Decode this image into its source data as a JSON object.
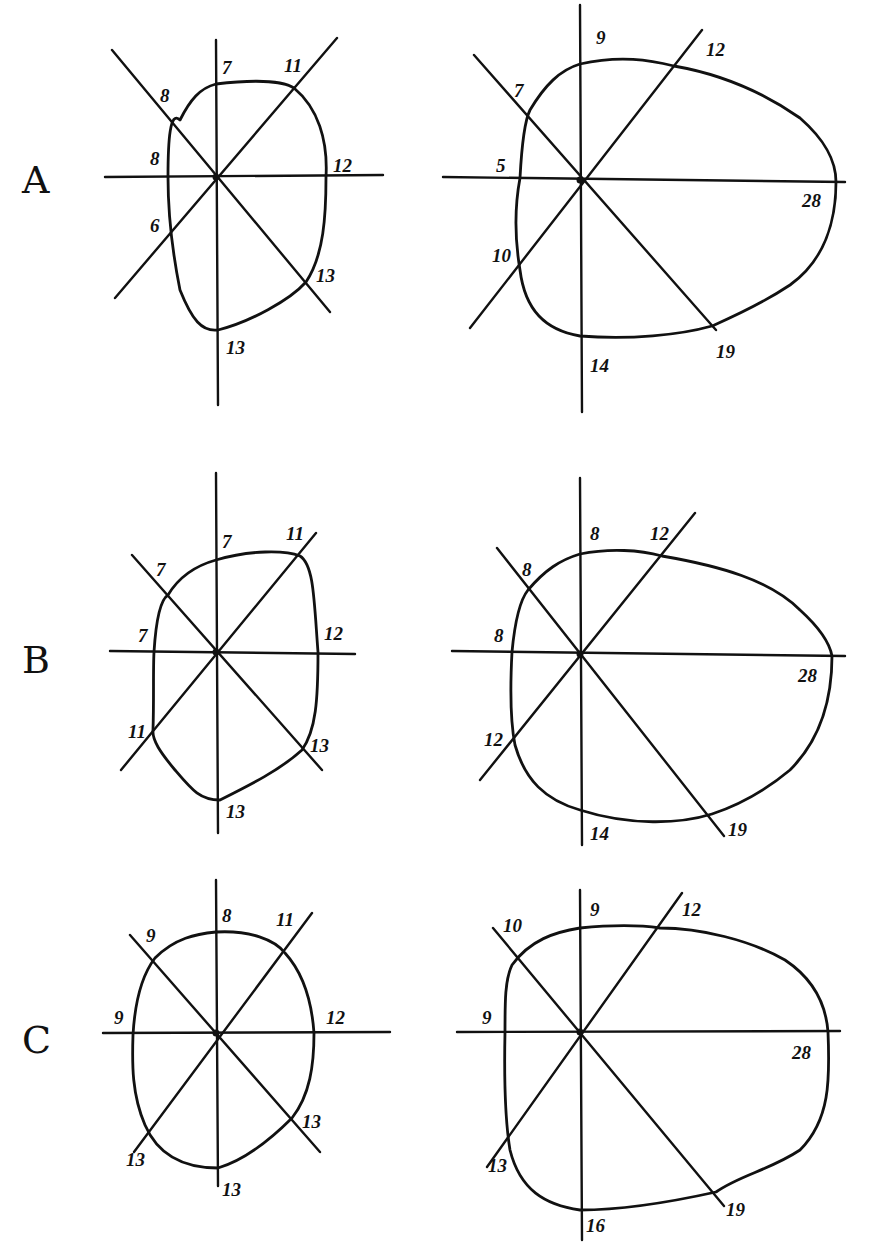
{
  "figure": {
    "rows": [
      {
        "letter": "A",
        "letter_pos": [
          22,
          193
        ],
        "panels": [
          {
            "id": "A-left",
            "center": [
              216,
              177
            ],
            "axes": {
              "vertical": [
                [
                  216,
                  40
                ],
                [
                  218,
                  405
                ]
              ],
              "horizontal": [
                [
                  105,
                  177
                ],
                [
                  383,
                  175
                ]
              ],
              "diag_up": [
                [
                  115,
                  298
                ],
                [
                  337,
                  38
                ]
              ],
              "diag_down": [
                [
                  112,
                  50
                ],
                [
                  330,
                  312
                ]
              ]
            },
            "outline": "M216,84 C250,80 282,80 294,88 C318,108 328,140 326,177 C326,215 324,255 306,282 C290,300 250,322 218,330 C202,332 192,320 180,290 C172,250 168,215 168,177 C168,140 170,110 180,120 C190,100 200,88 216,84 Z",
            "labels": [
              {
                "text": "7",
                "x": 222,
                "y": 74
              },
              {
                "text": "11",
                "x": 284,
                "y": 72
              },
              {
                "text": "8",
                "x": 160,
                "y": 102
              },
              {
                "text": "8",
                "x": 150,
                "y": 165
              },
              {
                "text": "12",
                "x": 333,
                "y": 172
              },
              {
                "text": "6",
                "x": 150,
                "y": 232
              },
              {
                "text": "13",
                "x": 316,
                "y": 282
              },
              {
                "text": "13",
                "x": 226,
                "y": 354
              }
            ]
          },
          {
            "id": "A-right",
            "center": [
              580,
              180
            ],
            "axes": {
              "vertical": [
                [
                  580,
                  5
                ],
                [
                  582,
                  412
                ]
              ],
              "horizontal": [
                [
                  443,
                  177
                ],
                [
                  845,
                  182
                ]
              ],
              "diag_up": [
                [
                  470,
                  328
                ],
                [
                  702,
                  30
                ]
              ],
              "diag_down": [
                [
                  474,
                  55
                ],
                [
                  716,
                  330
                ]
              ]
            },
            "outline": "M580,64 C620,55 650,60 674,66 C720,74 760,90 800,118 C825,140 836,160 836,182 C836,220 825,260 790,285 C760,305 730,318 712,326 C680,335 630,340 580,336 C545,330 525,310 520,270 C515,240 514,210 520,178 C522,140 525,120 530,110 C545,85 560,70 580,64 Z",
            "labels": [
              {
                "text": "9",
                "x": 596,
                "y": 44
              },
              {
                "text": "12",
                "x": 706,
                "y": 56
              },
              {
                "text": "7",
                "x": 514,
                "y": 97
              },
              {
                "text": "5",
                "x": 496,
                "y": 172
              },
              {
                "text": "28",
                "x": 802,
                "y": 207
              },
              {
                "text": "10",
                "x": 492,
                "y": 262
              },
              {
                "text": "14",
                "x": 590,
                "y": 372
              },
              {
                "text": "19",
                "x": 716,
                "y": 358
              }
            ]
          }
        ]
      },
      {
        "letter": "B",
        "letter_pos": [
          22,
          673
        ],
        "panels": [
          {
            "id": "B-left",
            "center": [
              216,
              652
            ],
            "axes": {
              "vertical": [
                [
                  216,
                  473
                ],
                [
                  218,
                  833
                ]
              ],
              "horizontal": [
                [
                  110,
                  651
                ],
                [
                  355,
                  654
                ]
              ],
              "diag_up": [
                [
                  121,
                  770
                ],
                [
                  316,
                  533
                ]
              ],
              "diag_down": [
                [
                  132,
                  555
                ],
                [
                  322,
                  770
                ]
              ]
            },
            "outline": "M216,560 C250,550 285,550 300,556 C314,565 314,600 318,652 C318,700 316,730 302,750 C280,770 250,785 220,800 C200,800 192,790 175,770 C160,752 152,740 153,730 C154,700 153,670 154,652 C156,620 160,600 168,595 C180,575 198,565 216,560 Z",
            "labels": [
              {
                "text": "7",
                "x": 222,
                "y": 548
              },
              {
                "text": "11",
                "x": 286,
                "y": 540
              },
              {
                "text": "7",
                "x": 156,
                "y": 576
              },
              {
                "text": "7",
                "x": 138,
                "y": 642
              },
              {
                "text": "12",
                "x": 324,
                "y": 640
              },
              {
                "text": "11",
                "x": 128,
                "y": 738
              },
              {
                "text": "13",
                "x": 310,
                "y": 752
              },
              {
                "text": "13",
                "x": 226,
                "y": 818
              }
            ]
          },
          {
            "id": "B-right",
            "center": [
              580,
              654
            ],
            "axes": {
              "vertical": [
                [
                  580,
                  478
                ],
                [
                  582,
                  845
                ]
              ],
              "horizontal": [
                [
                  452,
                  651
                ],
                [
                  845,
                  656
                ]
              ],
              "diag_up": [
                [
                  480,
                  780
                ],
                [
                  695,
                  513
                ]
              ],
              "diag_down": [
                [
                  497,
                  548
                ],
                [
                  724,
                  836
                ]
              ]
            },
            "outline": "M580,554 C610,548 640,550 662,556 C720,566 770,580 800,610 C822,630 830,645 832,656 C832,700 820,740 790,770 C760,795 730,808 712,814 C680,824 630,826 580,810 C545,800 525,780 515,745 C510,720 510,690 512,652 C515,620 520,600 528,590 C545,570 560,560 580,554 Z",
            "labels": [
              {
                "text": "8",
                "x": 590,
                "y": 540
              },
              {
                "text": "12",
                "x": 650,
                "y": 540
              },
              {
                "text": "8",
                "x": 522,
                "y": 576
              },
              {
                "text": "8",
                "x": 494,
                "y": 642
              },
              {
                "text": "28",
                "x": 798,
                "y": 682
              },
              {
                "text": "12",
                "x": 484,
                "y": 746
              },
              {
                "text": "14",
                "x": 590,
                "y": 840
              },
              {
                "text": "19",
                "x": 728,
                "y": 836
              }
            ]
          }
        ]
      },
      {
        "letter": "C",
        "letter_pos": [
          22,
          1053
        ],
        "panels": [
          {
            "id": "C-left",
            "center": [
              216,
              1033
            ],
            "axes": {
              "vertical": [
                [
                  216,
                  880
                ],
                [
                  218,
                  1186
                ]
              ],
              "horizontal": [
                [
                  103,
                  1033
                ],
                [
                  390,
                  1032
                ]
              ],
              "diag_up": [
                [
                  134,
                  1152
                ],
                [
                  312,
                  913
                ]
              ],
              "diag_down": [
                [
                  130,
                  935
                ],
                [
                  320,
                  1152
                ]
              ]
            },
            "outline": "M216,932 C250,930 275,940 285,953 C305,975 312,1005 314,1033 C314,1065 310,1095 292,1118 C270,1140 245,1160 218,1168 C190,1168 160,1160 145,1125 C132,1095 132,1065 133,1035 C135,1000 142,975 155,958 C175,938 196,934 216,932 Z",
            "labels": [
              {
                "text": "8",
                "x": 222,
                "y": 922
              },
              {
                "text": "11",
                "x": 276,
                "y": 926
              },
              {
                "text": "9",
                "x": 146,
                "y": 942
              },
              {
                "text": "9",
                "x": 114,
                "y": 1024
              },
              {
                "text": "12",
                "x": 326,
                "y": 1024
              },
              {
                "text": "13",
                "x": 302,
                "y": 1128
              },
              {
                "text": "13",
                "x": 126,
                "y": 1166
              },
              {
                "text": "13",
                "x": 222,
                "y": 1196
              }
            ]
          },
          {
            "id": "C-right",
            "center": [
              580,
              1032
            ],
            "axes": {
              "vertical": [
                [
                  580,
                  890
                ],
                [
                  582,
                  1240
                ]
              ],
              "horizontal": [
                [
                  457,
                  1032
                ],
                [
                  840,
                  1031
                ]
              ],
              "diag_up": [
                [
                  487,
                  1167
                ],
                [
                  682,
                  893
                ]
              ],
              "diag_down": [
                [
                  493,
                  928
                ],
                [
                  724,
                  1206
                ]
              ]
            },
            "outline": "M580,928 C610,925 640,925 660,928 C700,928 750,940 785,960 C815,980 826,1005 828,1032 C830,1080 830,1120 800,1150 C770,1170 740,1175 716,1192 C680,1200 630,1210 580,1210 C545,1205 520,1190 510,1150 C505,1120 504,1080 505,1032 C505,1000 505,980 512,965 C530,940 555,932 580,928 Z",
            "labels": [
              {
                "text": "9",
                "x": 590,
                "y": 916
              },
              {
                "text": "12",
                "x": 682,
                "y": 916
              },
              {
                "text": "10",
                "x": 503,
                "y": 932
              },
              {
                "text": "9",
                "x": 482,
                "y": 1024
              },
              {
                "text": "28",
                "x": 792,
                "y": 1059
              },
              {
                "text": "13",
                "x": 488,
                "y": 1172
              },
              {
                "text": "19",
                "x": 726,
                "y": 1216
              },
              {
                "text": "16",
                "x": 586,
                "y": 1232
              }
            ]
          }
        ]
      }
    ]
  }
}
